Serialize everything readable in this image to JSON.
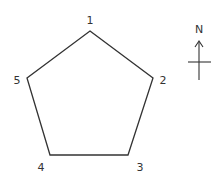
{
  "diagram": {
    "type": "pentagon-with-numbered-vertices",
    "vertices": [
      {
        "label": "1",
        "x": 90,
        "y": 31,
        "label_x": 90,
        "label_y": 24
      },
      {
        "label": "2",
        "x": 153,
        "y": 78,
        "label_x": 163,
        "label_y": 84
      },
      {
        "label": "3",
        "x": 128,
        "y": 155,
        "label_x": 140,
        "label_y": 171
      },
      {
        "label": "4",
        "x": 50,
        "y": 155,
        "label_x": 41,
        "label_y": 171
      },
      {
        "label": "5",
        "x": 27,
        "y": 78,
        "label_x": 17,
        "label_y": 84
      }
    ],
    "compass": {
      "label": "N"
    },
    "colors": {
      "stroke": "#333333",
      "background": "#ffffff"
    }
  }
}
